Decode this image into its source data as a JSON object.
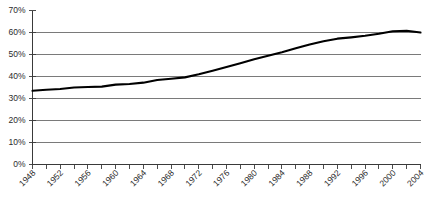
{
  "chart_data": {
    "type": "line",
    "title": "",
    "subtitle": "",
    "xlabel": "",
    "ylabel": "",
    "xlim": [
      1948,
      2004
    ],
    "ylim": [
      0,
      70
    ],
    "ytick_labels": [
      "70%",
      "60%",
      "50%",
      "40%",
      "30%",
      "20%",
      "10%",
      "0%"
    ],
    "ytick_values": [
      70,
      60,
      50,
      40,
      30,
      20,
      10,
      0
    ],
    "ytick_suffix": "%",
    "ytick_step": 10,
    "grid": true,
    "gridlines_at": [
      60,
      50,
      40,
      30,
      20,
      10
    ],
    "legend": false,
    "legend_position": "none",
    "xtick_labels": [
      "1948",
      "1952",
      "1956",
      "1960",
      "1964",
      "1968",
      "1972",
      "1976",
      "1980",
      "1984",
      "1988",
      "1992",
      "1996",
      "2000",
      "2004"
    ],
    "xtick_label_values": [
      1948,
      1952,
      1956,
      1960,
      1964,
      1968,
      1972,
      1976,
      1980,
      1984,
      1988,
      1992,
      1996,
      2000,
      2004
    ],
    "xtick_label_rotation": -45,
    "x_minor_tick_step": 2,
    "x": [
      1948,
      1950,
      1952,
      1954,
      1956,
      1958,
      1960,
      1962,
      1964,
      1966,
      1968,
      1970,
      1972,
      1974,
      1976,
      1978,
      1980,
      1982,
      1984,
      1986,
      1988,
      1990,
      1992,
      1994,
      1996,
      1998,
      2000,
      2002,
      2004
    ],
    "series": [
      {
        "name": "",
        "color": "#000000",
        "values": [
          33.5,
          34.0,
          34.3,
          35.0,
          35.2,
          35.4,
          36.3,
          36.6,
          37.2,
          38.4,
          39.0,
          39.6,
          41.0,
          42.6,
          44.3,
          46.0,
          47.8,
          49.4,
          51.0,
          52.8,
          54.5,
          56.0,
          57.2,
          57.8,
          58.5,
          59.4,
          60.6,
          60.8,
          60.0
        ]
      }
    ],
    "colors": {
      "line": "#000000",
      "grid": "#6b6b6b",
      "axis": "#3a3a3a",
      "text": "#2b2b2b",
      "background": "#ffffff"
    }
  }
}
